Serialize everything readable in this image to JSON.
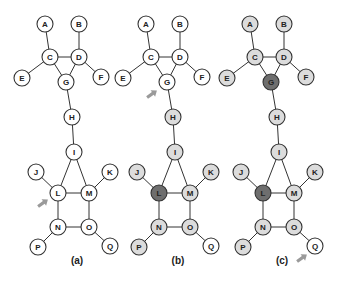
{
  "colors": {
    "white": "#ffffff",
    "light": "#dcdcdc",
    "dark": "#6e6e6e",
    "stroke": "#333333",
    "arrow": "#9a9a9a"
  },
  "graph": {
    "nodes": {
      "A": [
        45,
        24
      ],
      "B": [
        79,
        24
      ],
      "C": [
        50,
        57
      ],
      "D": [
        79,
        57
      ],
      "E": [
        22,
        78
      ],
      "F": [
        101,
        77
      ],
      "G": [
        66,
        82
      ],
      "H": [
        72,
        117
      ],
      "I": [
        74,
        152
      ],
      "J": [
        36,
        172
      ],
      "K": [
        110,
        172
      ],
      "L": [
        58,
        193
      ],
      "M": [
        89,
        193
      ],
      "N": [
        58,
        227
      ],
      "O": [
        89,
        227
      ],
      "P": [
        38,
        247
      ],
      "Q": [
        110,
        246
      ]
    },
    "edges": [
      [
        "A",
        "C"
      ],
      [
        "B",
        "D"
      ],
      [
        "C",
        "D"
      ],
      [
        "C",
        "E"
      ],
      [
        "D",
        "F"
      ],
      [
        "C",
        "G"
      ],
      [
        "D",
        "G"
      ],
      [
        "G",
        "H"
      ],
      [
        "H",
        "I"
      ],
      [
        "I",
        "L"
      ],
      [
        "I",
        "M"
      ],
      [
        "J",
        "L"
      ],
      [
        "K",
        "M"
      ],
      [
        "L",
        "M"
      ],
      [
        "L",
        "N"
      ],
      [
        "M",
        "O"
      ],
      [
        "N",
        "O"
      ],
      [
        "N",
        "P"
      ],
      [
        "O",
        "Q"
      ]
    ]
  },
  "panels": [
    {
      "label": "(a)",
      "offset_x": 0,
      "label_x": 77,
      "fills": {},
      "arrow": {
        "target": "L",
        "x": 43,
        "y": 203
      }
    },
    {
      "label": "(b)",
      "offset_x": 101,
      "label_x": 178,
      "fills": {
        "H": "light",
        "I": "light",
        "J": "light",
        "K": "light",
        "L": "dark",
        "M": "light",
        "N": "light",
        "O": "light",
        "P": "light"
      },
      "arrow": {
        "target": "G",
        "x": 51,
        "y": 94
      }
    },
    {
      "label": "(c)",
      "offset_x": 205,
      "label_x": 282,
      "fills": {
        "A": "light",
        "B": "light",
        "C": "light",
        "D": "light",
        "E": "light",
        "F": "light",
        "G": "dark",
        "H": "light",
        "I": "light",
        "J": "light",
        "K": "light",
        "L": "dark",
        "M": "light",
        "N": "light",
        "O": "light",
        "P": "light"
      },
      "arrow": {
        "target": "Q",
        "x": 97,
        "y": 258
      }
    }
  ]
}
